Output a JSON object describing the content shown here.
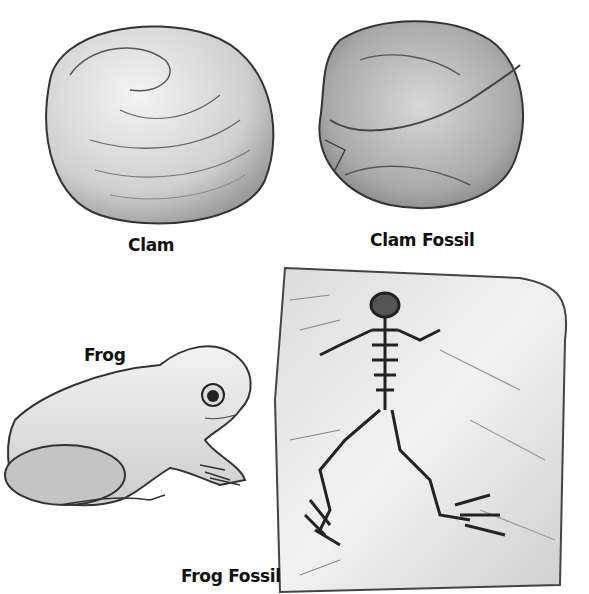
{
  "figure": {
    "panels": [
      {
        "id": "clam",
        "label": "Clam",
        "subject": "clam-shell-drawing"
      },
      {
        "id": "clam-fossil",
        "label": "Clam Fossil",
        "subject": "clam-fossil-drawing"
      },
      {
        "id": "frog",
        "label": "Frog",
        "subject": "frog-drawing"
      },
      {
        "id": "frog-fossil",
        "label": "Frog Fossil",
        "subject": "frog-fossil-drawing"
      }
    ],
    "colors": {
      "background": "#ffffff",
      "ink": "#111111",
      "wash_light": "#e6e6e6",
      "wash_mid": "#b5b5b5",
      "wash_dark": "#555555"
    }
  }
}
